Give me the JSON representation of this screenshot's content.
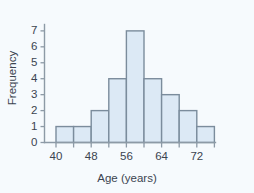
{
  "chart_data": {
    "type": "bar",
    "title": "",
    "subtitle": "",
    "xlabel": "Age (years)",
    "ylabel": "Frequency",
    "categories": [
      "40-44",
      "44-48",
      "48-52",
      "52-56",
      "56-60",
      "60-64",
      "64-68",
      "68-72",
      "72-76"
    ],
    "bin_edges": [
      40,
      44,
      48,
      52,
      56,
      60,
      64,
      68,
      72,
      76
    ],
    "bin_width": 4,
    "values": [
      1,
      1,
      2,
      4,
      7,
      4,
      3,
      2,
      1
    ],
    "total_frequency": 25,
    "xlim": [
      38,
      79
    ],
    "ylim": [
      0,
      7.4
    ],
    "x_major_ticks": [
      40,
      48,
      56,
      64,
      72
    ],
    "x_major_tick_labels": [
      "40",
      "48",
      "56",
      "64",
      "72"
    ],
    "x_minor_ticks": [
      44,
      52,
      60,
      68,
      76
    ],
    "y_ticks": [
      0,
      1,
      2,
      3,
      4,
      5,
      6,
      7
    ],
    "y_tick_labels": [
      "0",
      "1",
      "2",
      "3",
      "4",
      "5",
      "6",
      "7"
    ],
    "grid": false,
    "legend": false,
    "legend_position": "none",
    "bar_fill_color": "#dce9f5",
    "bar_stroke_color": "#7b8c9c",
    "axis_color": "#8d9aa6",
    "text_color": "#3b4450",
    "background_color": "#f6fafd"
  }
}
